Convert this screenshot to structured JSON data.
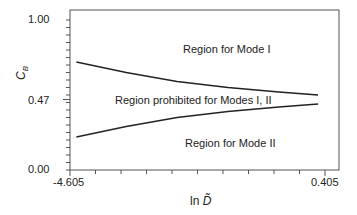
{
  "chart_data": {
    "type": "line",
    "title": "",
    "xlabel": "ln D̃",
    "ylabel": "C̃B",
    "xlim": [
      -4.605,
      0.405
    ],
    "ylim": [
      0.0,
      1.0
    ],
    "x_ticks_labeled": [
      "-4.605",
      "0.405"
    ],
    "y_ticks_labeled": [
      "0.00",
      "0.47",
      "1.00"
    ],
    "grid": false,
    "series": [
      {
        "name": "Upper boundary (Mode I)",
        "x": [
          -4.48,
          -3.5,
          -2.5,
          -1.5,
          -0.5,
          0.27
        ],
        "y": [
          0.72,
          0.65,
          0.59,
          0.55,
          0.52,
          0.5
        ]
      },
      {
        "name": "Lower boundary (Mode II)",
        "x": [
          -4.48,
          -3.5,
          -2.5,
          -1.5,
          -0.5,
          0.27
        ],
        "y": [
          0.22,
          0.29,
          0.35,
          0.39,
          0.42,
          0.44
        ]
      }
    ],
    "annotations": [
      "Region for Mode I",
      "Region prohibited for Modes I, II",
      "Region for Mode II"
    ]
  },
  "axes": {
    "y_label_main": "C",
    "y_label_sub": "B",
    "y_ticks": [
      "1.00",
      "0.47",
      "0.00"
    ],
    "x_ticks": [
      "-4.605",
      "0.405"
    ],
    "x_label_prefix": "ln ",
    "x_label_var": "D̃"
  },
  "regions": {
    "mode1": "Region for Mode I",
    "prohibited": "Region prohibited for Modes I, II",
    "mode2": "Region for Mode II"
  }
}
